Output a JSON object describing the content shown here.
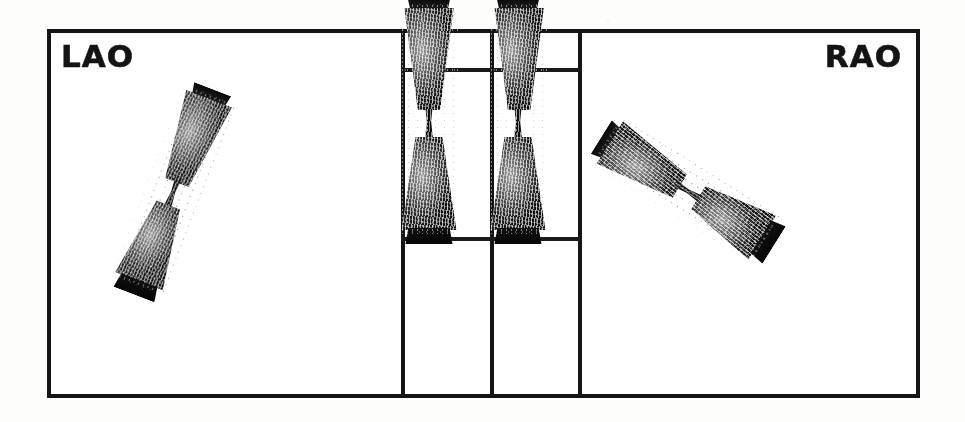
{
  "figure": {
    "kind": "scintigraphy-multipanel",
    "ink_color": "#151515",
    "background_color": "#ffffff",
    "panel_count": 4
  },
  "frame": {
    "border_color": "#151515",
    "border_width_px": 4,
    "left_px": 47,
    "top_px": 29,
    "width_px": 873,
    "height_px": 369
  },
  "dividers": {
    "vertical_x_px": [
      401,
      490,
      578
    ],
    "horizontal_rules_y_px": [
      68,
      237
    ]
  },
  "panels": [
    {
      "id": "lao",
      "label": "LAO",
      "label_position": "top-left",
      "object": "bowtie-uptake",
      "tilt_deg": 21,
      "has_reference_lines": false
    },
    {
      "id": "center-left",
      "label": "",
      "object": "bowtie-uptake",
      "tilt_deg": 0,
      "has_reference_lines": true
    },
    {
      "id": "center-right",
      "label": "",
      "object": "bowtie-uptake",
      "tilt_deg": 0,
      "has_reference_lines": true
    },
    {
      "id": "rao",
      "label": "RAO",
      "label_position": "top-right",
      "object": "bowtie-uptake",
      "tilt_deg": -58,
      "has_reference_lines": false
    }
  ],
  "labels": {
    "lao": "LAO",
    "rao": "RAO"
  },
  "alt_text": "Four-panel photocopied scintigram: left panel labelled LAO with a diagonally tilted hourglass-shaped uptake region, two narrow central panels each showing an upright hourglass-shaped uptake region crossed by upper and lower horizontal reference lines, and a right panel labelled RAO with an obliquely tilted hourglass-shaped uptake region."
}
